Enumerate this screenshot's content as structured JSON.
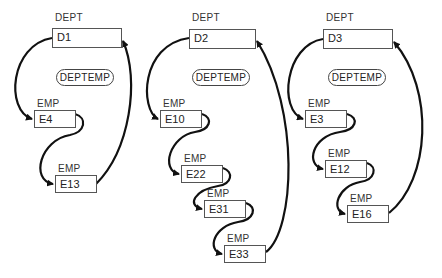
{
  "diagram": {
    "set_name": "DEPTEMP",
    "owner_type": "DEPT",
    "member_type": "EMP",
    "occurrences": [
      {
        "owner": "D1",
        "members": [
          "E4",
          "E13"
        ]
      },
      {
        "owner": "D2",
        "members": [
          "E10",
          "E22",
          "E31",
          "E33"
        ]
      },
      {
        "owner": "D3",
        "members": [
          "E3",
          "E12",
          "E16"
        ]
      }
    ],
    "line_color": "#111111",
    "box_border_color": "#555555"
  },
  "labels": {
    "d1_type": "DEPT",
    "d1": "D1",
    "d1_set": "DEPTEMP",
    "e4_type": "EMP",
    "e4": "E4",
    "e13_type": "EMP",
    "e13": "E13",
    "d2_type": "DEPT",
    "d2": "D2",
    "d2_set": "DEPTEMP",
    "e10_type": "EMP",
    "e10": "E10",
    "e22_type": "EMP",
    "e22": "E22",
    "e31_type": "EMP",
    "e31": "E31",
    "e33_type": "EMP",
    "e33": "E33",
    "d3_type": "DEPT",
    "d3": "D3",
    "d3_set": "DEPTEMP",
    "e3_type": "EMP",
    "e3": "E3",
    "e12_type": "EMP",
    "e12": "E12",
    "e16_type": "EMP",
    "e16": "E16"
  }
}
